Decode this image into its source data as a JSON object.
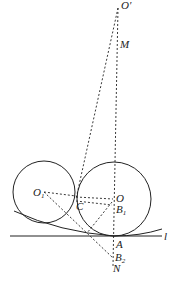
{
  "diagram": {
    "type": "geometry-tangent-circles",
    "labels": {
      "O_prime": "O′",
      "M": "M",
      "O1": "O",
      "O1_sub": "1",
      "C": "C",
      "O": "O",
      "B1": "B",
      "B1_sub": "1",
      "A": "A",
      "B2": "B",
      "B2_sub": "2",
      "N": "N",
      "l": "l"
    },
    "points": {
      "O_prime": [
        118,
        8
      ],
      "M": [
        118,
        45
      ],
      "O1": [
        44,
        192
      ],
      "C": [
        76,
        199
      ],
      "O": [
        114,
        199
      ],
      "B1": [
        112,
        207
      ],
      "A": [
        114,
        236
      ],
      "B2": [
        113,
        258
      ],
      "N": [
        113,
        266
      ]
    },
    "circles": [
      {
        "name": "circle-O1",
        "cx": 44,
        "cy": 192,
        "r": 31
      },
      {
        "name": "circle-O",
        "cx": 114,
        "cy": 199,
        "r": 37
      }
    ],
    "colors": {
      "stroke": "#222222"
    }
  }
}
